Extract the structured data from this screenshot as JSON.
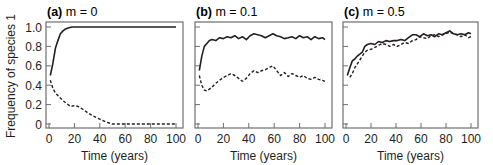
{
  "figure": {
    "ylabel": "Frequency of species 1",
    "xlabel": "Time (years)",
    "yticks": [
      "0",
      "0.2",
      "0.4",
      "0.6",
      "0.8",
      "1.0"
    ],
    "xticks": [
      "0",
      "20",
      "40",
      "60",
      "80",
      "100"
    ],
    "line_color": "#231f20",
    "frame_color": "#6d6e71"
  },
  "chart_data": [
    {
      "type": "line",
      "panel": "(a)",
      "title": "m = 0",
      "xlabel": "Time (years)",
      "ylabel": "Frequency of species 1",
      "xlim": [
        0,
        100
      ],
      "ylim": [
        0,
        1.0
      ],
      "grid": false,
      "series": [
        {
          "name": "solid",
          "style": "solid",
          "x": [
            1,
            3,
            5,
            7,
            9,
            11,
            13,
            15,
            18,
            25,
            40,
            60,
            80,
            100
          ],
          "y": [
            0.5,
            0.62,
            0.78,
            0.86,
            0.93,
            0.96,
            0.98,
            0.99,
            1.0,
            1.0,
            1.0,
            1.0,
            1.0,
            1.0
          ]
        },
        {
          "name": "dashed",
          "style": "dashed",
          "x": [
            1,
            3,
            5,
            8,
            11,
            14,
            17,
            20,
            23,
            27,
            31,
            35,
            40,
            45,
            50,
            60,
            70,
            80,
            90,
            100
          ],
          "y": [
            0.45,
            0.37,
            0.32,
            0.28,
            0.24,
            0.21,
            0.18,
            0.19,
            0.18,
            0.15,
            0.11,
            0.08,
            0.05,
            0.02,
            0.0,
            0.0,
            0.0,
            0.0,
            0.0,
            0.0
          ]
        }
      ]
    },
    {
      "type": "line",
      "panel": "(b)",
      "title": "m = 0.1",
      "xlabel": "Time (years)",
      "xlim": [
        0,
        100
      ],
      "ylim": [
        0,
        1.0
      ],
      "grid": false,
      "series": [
        {
          "name": "solid",
          "style": "solid",
          "x": [
            1,
            3,
            5,
            7,
            9,
            11,
            14,
            17,
            20,
            23,
            26,
            29,
            32,
            35,
            38,
            41,
            44,
            47,
            50,
            53,
            56,
            59,
            62,
            65,
            68,
            71,
            74,
            77,
            80,
            83,
            86,
            89,
            92,
            95,
            98,
            100
          ],
          "y": [
            0.55,
            0.7,
            0.8,
            0.83,
            0.86,
            0.87,
            0.86,
            0.89,
            0.88,
            0.9,
            0.89,
            0.91,
            0.88,
            0.9,
            0.87,
            0.91,
            0.93,
            0.92,
            0.91,
            0.89,
            0.91,
            0.93,
            0.91,
            0.9,
            0.88,
            0.89,
            0.9,
            0.88,
            0.91,
            0.89,
            0.9,
            0.87,
            0.9,
            0.88,
            0.89,
            0.87
          ]
        },
        {
          "name": "dashed",
          "style": "dashed",
          "x": [
            1,
            3,
            5,
            7,
            9,
            11,
            14,
            17,
            20,
            23,
            26,
            29,
            32,
            35,
            38,
            41,
            44,
            47,
            50,
            53,
            56,
            59,
            62,
            65,
            68,
            71,
            74,
            77,
            80,
            83,
            86,
            89,
            92,
            95,
            98,
            100
          ],
          "y": [
            0.5,
            0.4,
            0.35,
            0.34,
            0.36,
            0.38,
            0.42,
            0.45,
            0.48,
            0.5,
            0.52,
            0.5,
            0.47,
            0.44,
            0.47,
            0.52,
            0.55,
            0.53,
            0.55,
            0.56,
            0.58,
            0.6,
            0.55,
            0.5,
            0.53,
            0.49,
            0.52,
            0.5,
            0.48,
            0.5,
            0.47,
            0.46,
            0.48,
            0.46,
            0.45,
            0.44
          ]
        }
      ]
    },
    {
      "type": "line",
      "panel": "(c)",
      "title": "m = 0.5",
      "xlabel": "Time (years)",
      "xlim": [
        0,
        100
      ],
      "ylim": [
        0,
        1.0
      ],
      "grid": false,
      "series": [
        {
          "name": "solid",
          "style": "solid",
          "x": [
            1,
            3,
            5,
            7,
            9,
            11,
            13,
            15,
            17,
            20,
            23,
            26,
            29,
            32,
            35,
            38,
            41,
            44,
            47,
            50,
            53,
            56,
            59,
            62,
            65,
            68,
            71,
            74,
            77,
            80,
            83,
            86,
            89,
            92,
            95,
            98,
            100
          ],
          "y": [
            0.5,
            0.58,
            0.65,
            0.67,
            0.7,
            0.72,
            0.74,
            0.8,
            0.82,
            0.83,
            0.82,
            0.85,
            0.84,
            0.86,
            0.85,
            0.86,
            0.86,
            0.87,
            0.86,
            0.89,
            0.92,
            0.92,
            0.9,
            0.93,
            0.91,
            0.92,
            0.9,
            0.93,
            0.92,
            0.94,
            0.96,
            0.93,
            0.92,
            0.93,
            0.92,
            0.94,
            0.93
          ]
        },
        {
          "name": "dashed",
          "style": "dashed",
          "x": [
            3,
            5,
            7,
            9,
            11,
            13,
            15,
            17,
            20,
            23,
            26,
            29,
            32,
            35,
            38,
            41,
            44,
            47,
            50,
            53,
            56,
            59,
            62,
            65,
            68,
            71,
            74,
            77,
            80,
            83,
            86,
            89,
            92,
            95,
            98,
            100
          ],
          "y": [
            0.48,
            0.52,
            0.58,
            0.62,
            0.66,
            0.7,
            0.74,
            0.76,
            0.77,
            0.79,
            0.81,
            0.83,
            0.82,
            0.8,
            0.82,
            0.8,
            0.82,
            0.84,
            0.83,
            0.86,
            0.87,
            0.9,
            0.89,
            0.88,
            0.91,
            0.92,
            0.9,
            0.92,
            0.93,
            0.95,
            0.93,
            0.92,
            0.9,
            0.92,
            0.89,
            0.9
          ]
        }
      ]
    }
  ]
}
